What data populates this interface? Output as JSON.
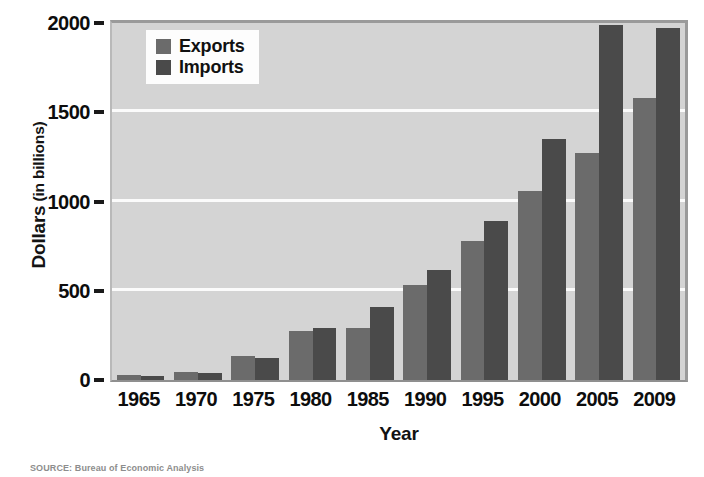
{
  "chart_data": {
    "type": "bar",
    "title": "",
    "subtitle": "",
    "xlabel": "Year",
    "ylabel": "Dollars",
    "ylabel_unit": "(in billions)",
    "ylabel_full": "Dollars (in billions)",
    "categories": [
      "1965",
      "1970",
      "1975",
      "1980",
      "1985",
      "1990",
      "1995",
      "2000",
      "2005",
      "2009"
    ],
    "series": [
      {
        "name": "Exports",
        "color": "#6b6b6b",
        "values": [
          27,
          43,
          133,
          272,
          289,
          535,
          780,
          1060,
          1270,
          1580
        ]
      },
      {
        "name": "Imports",
        "color": "#4a4a4a",
        "values": [
          22,
          40,
          123,
          291,
          410,
          616,
          890,
          1350,
          1990,
          1970
        ]
      }
    ],
    "ylim": [
      0,
      2000
    ],
    "yticks": [
      0,
      500,
      1000,
      1500,
      2000
    ],
    "ytick_labels": [
      "0",
      "500",
      "1000",
      "1500",
      "2000"
    ],
    "grid": true,
    "grid_color": "#fbfbfb",
    "legend_position": "top-left",
    "plot_background": "#d4d4d4",
    "figure_background": "#ffffff"
  },
  "legend": {
    "items": [
      {
        "label": "Exports",
        "color": "#6b6b6b"
      },
      {
        "label": "Imports",
        "color": "#4a4a4a"
      }
    ]
  },
  "axes": {
    "x_title": "Year",
    "y_title_main": "Dollars",
    "y_title_unit": "(in billions)"
  },
  "source": {
    "label": "SOURCE:",
    "text": "Bureau of Economic Analysis",
    "full": "SOURCE: Bureau of Economic Analysis"
  }
}
